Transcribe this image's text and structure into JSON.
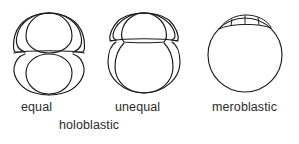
{
  "figure": {
    "background_color": "#ffffff",
    "line_color": "#1a1a1a",
    "text_color": "#2b2b2b",
    "width": 299,
    "height": 144
  },
  "captions": {
    "equal": "equal",
    "unequal": "unequal",
    "meroblastic": "meroblastic",
    "holoblastic": "holoblastic"
  },
  "diagrams": [
    {
      "id": "equal-holoblastic",
      "label": "equal",
      "group": "holoblastic",
      "description": "Embryo with four blastomeres of equal size, two above and two below the horizontal cleavage plane",
      "cell_count": 4,
      "cell_size": "equal",
      "center_x": 49,
      "center_y": 52
    },
    {
      "id": "unequal-holoblastic",
      "label": "unequal",
      "group": "holoblastic",
      "description": "Embryo with small micromeres above and large macromeres below the cleavage plane",
      "cell_count": 4,
      "cell_size": "unequal",
      "center_x": 144,
      "center_y": 52
    },
    {
      "id": "meroblastic",
      "label": "meroblastic",
      "group": "meroblastic",
      "description": "Large yolk sphere with a small cap of blastoderm cells at the animal pole",
      "cell_count": 4,
      "cell_size": "cap-only",
      "center_x": 245,
      "center_y": 55
    }
  ]
}
